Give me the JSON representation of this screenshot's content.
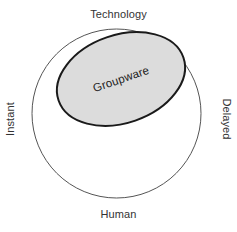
{
  "diagram": {
    "outer_circle": {
      "name": "context-circle",
      "cx": 116.5,
      "cy": 113.5,
      "r": 84.5,
      "stroke": "#555555",
      "stroke_width": 1,
      "fill": "#ffffff"
    },
    "inner_ellipse": {
      "name": "groupware-ellipse",
      "label": "Groupware",
      "cx": 121,
      "cy": 79,
      "rx": 66,
      "ry": 44,
      "rotation_deg": -19,
      "fill": "#dcdcdc",
      "stroke": "#1a1a1a",
      "stroke_width": 2
    },
    "axes": {
      "top_label": "Technology",
      "bottom_label": "Human",
      "left_label": "Instant",
      "right_label": "Delayed"
    }
  },
  "colors": {
    "background": "#ffffff",
    "text": "#333333",
    "ellipse_fill": "#dcdcdc",
    "ellipse_stroke": "#1a1a1a",
    "circle_stroke": "#555555"
  }
}
